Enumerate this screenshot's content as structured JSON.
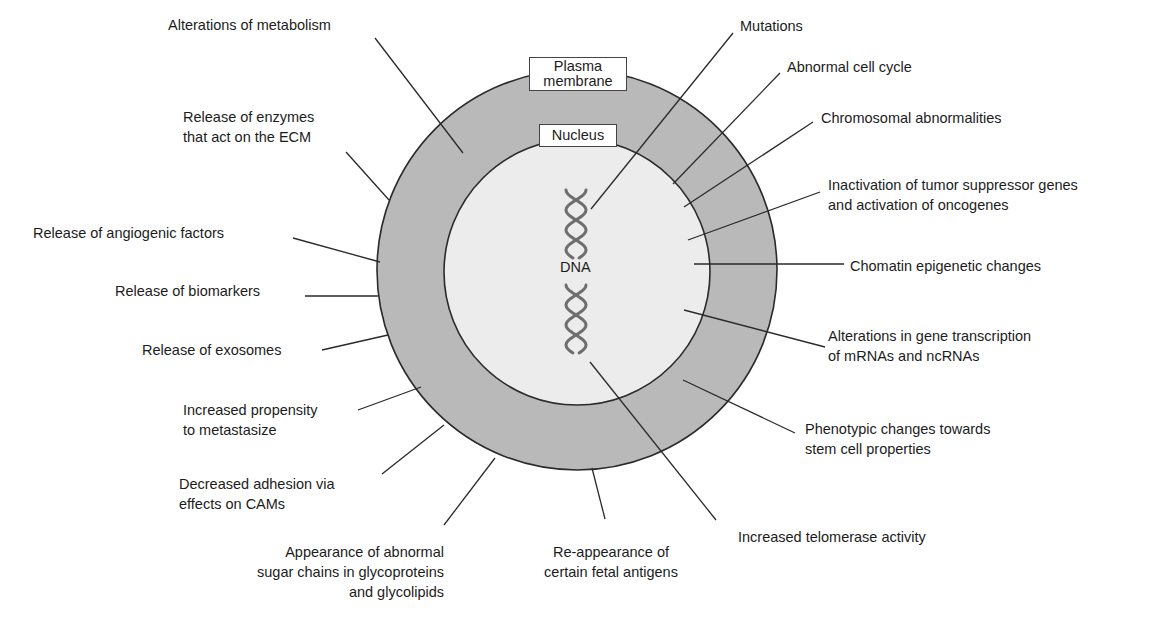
{
  "diagram": {
    "colors": {
      "cytoplasm": "#b9b9b9",
      "nucleus": "#ececec",
      "outline": "#2a2a2a",
      "leader": "#2a2a2a",
      "dna_strand": "#6e6e6e"
    },
    "cell": {
      "cx": 577,
      "cy": 270,
      "outer_r": 200,
      "nucleus_r": 133
    },
    "structure_labels": {
      "plasma_membrane": [
        "Plasma",
        "membrane"
      ],
      "nucleus": "Nucleus",
      "dna": "DNA"
    },
    "labels": [
      {
        "id": "alterations-metabolism",
        "lines": [
          "Alterations of metabolism"
        ],
        "x": 168,
        "y": 15,
        "align": "left",
        "leader": [
          [
            375,
            38
          ],
          [
            463,
            153
          ]
        ]
      },
      {
        "id": "release-enzymes-ecm",
        "lines": [
          "Release of enzymes",
          "that act on the ECM"
        ],
        "x": 183,
        "y": 107,
        "align": "left",
        "leader": [
          [
            346,
            152
          ],
          [
            389,
            200
          ]
        ]
      },
      {
        "id": "release-angiogenic-factors",
        "lines": [
          "Release of angiogenic factors"
        ],
        "x": 33,
        "y": 223,
        "align": "left",
        "leader": [
          [
            293,
            238
          ],
          [
            380,
            262
          ]
        ]
      },
      {
        "id": "release-biomarkers",
        "lines": [
          "Release of biomarkers"
        ],
        "x": 115,
        "y": 281,
        "align": "left",
        "leader": [
          [
            305,
            296
          ],
          [
            378,
            296
          ]
        ]
      },
      {
        "id": "release-exosomes",
        "lines": [
          "Release of exosomes"
        ],
        "x": 142,
        "y": 340,
        "align": "left",
        "leader": [
          [
            322,
            350
          ],
          [
            388,
            335
          ]
        ]
      },
      {
        "id": "increased-propensity-metastasize",
        "lines": [
          "Increased propensity",
          "to metastasize"
        ],
        "x": 183,
        "y": 400,
        "align": "left",
        "leader": [
          [
            358,
            410
          ],
          [
            421,
            387
          ]
        ]
      },
      {
        "id": "decreased-adhesion-cams",
        "lines": [
          "Decreased adhesion via",
          "effects on CAMs"
        ],
        "x": 179,
        "y": 474,
        "align": "left",
        "leader": [
          [
            382,
            474
          ],
          [
            444,
            425
          ]
        ]
      },
      {
        "id": "abnormal-sugar-chains",
        "lines": [
          "Appearance of abnormal",
          "sugar chains in glycoproteins",
          "and glycolipids"
        ],
        "x": 444,
        "y": 542,
        "align": "right",
        "leader": [
          [
            444,
            525
          ],
          [
            495,
            458
          ]
        ]
      },
      {
        "id": "fetal-antigens",
        "lines": [
          "Re-appearance of",
          "certain fetal antigens"
        ],
        "x": 611,
        "y": 542,
        "align": "center",
        "leader": [
          [
            605,
            519
          ],
          [
            592,
            468
          ]
        ]
      },
      {
        "id": "increased-telomerase",
        "lines": [
          "Increased telomerase activity"
        ],
        "x": 738,
        "y": 527,
        "align": "left",
        "leader": [
          [
            716,
            520
          ],
          [
            590,
            362
          ]
        ]
      },
      {
        "id": "phenotypic-stem-cell",
        "lines": [
          "Phenotypic changes towards",
          "stem cell properties"
        ],
        "x": 805,
        "y": 419,
        "align": "left",
        "leader": [
          [
            795,
            433
          ],
          [
            683,
            380
          ]
        ]
      },
      {
        "id": "alterations-gene-transcription",
        "lines": [
          "Alterations in gene transcription",
          "of mRNAs and ncRNAs"
        ],
        "x": 828,
        "y": 326,
        "align": "left",
        "leader": [
          [
            825,
            347
          ],
          [
            684,
            310
          ]
        ]
      },
      {
        "id": "chromatin-epigenetic",
        "lines": [
          "Chomatin epigenetic changes"
        ],
        "x": 850,
        "y": 256,
        "align": "left",
        "leader": [
          [
            844,
            264
          ],
          [
            694,
            264
          ]
        ]
      },
      {
        "id": "tumor-suppressor-oncogenes",
        "lines": [
          "Inactivation of tumor suppressor genes",
          "and activation of oncogenes"
        ],
        "x": 828,
        "y": 175,
        "align": "left",
        "leader": [
          [
            820,
            192
          ],
          [
            688,
            240
          ]
        ]
      },
      {
        "id": "chromosomal-abnormalities",
        "lines": [
          "Chromosomal abnormalities"
        ],
        "x": 821,
        "y": 108,
        "align": "left",
        "leader": [
          [
            813,
            122
          ],
          [
            684,
            207
          ]
        ]
      },
      {
        "id": "abnormal-cell-cycle",
        "lines": [
          "Abnormal cell cycle"
        ],
        "x": 787,
        "y": 57,
        "align": "left",
        "leader": [
          [
            780,
            73
          ],
          [
            673,
            184
          ]
        ]
      },
      {
        "id": "mutations",
        "lines": [
          "Mutations"
        ],
        "x": 740,
        "y": 16,
        "align": "left",
        "leader": [
          [
            733,
            33
          ],
          [
            591,
            209
          ]
        ]
      }
    ]
  }
}
